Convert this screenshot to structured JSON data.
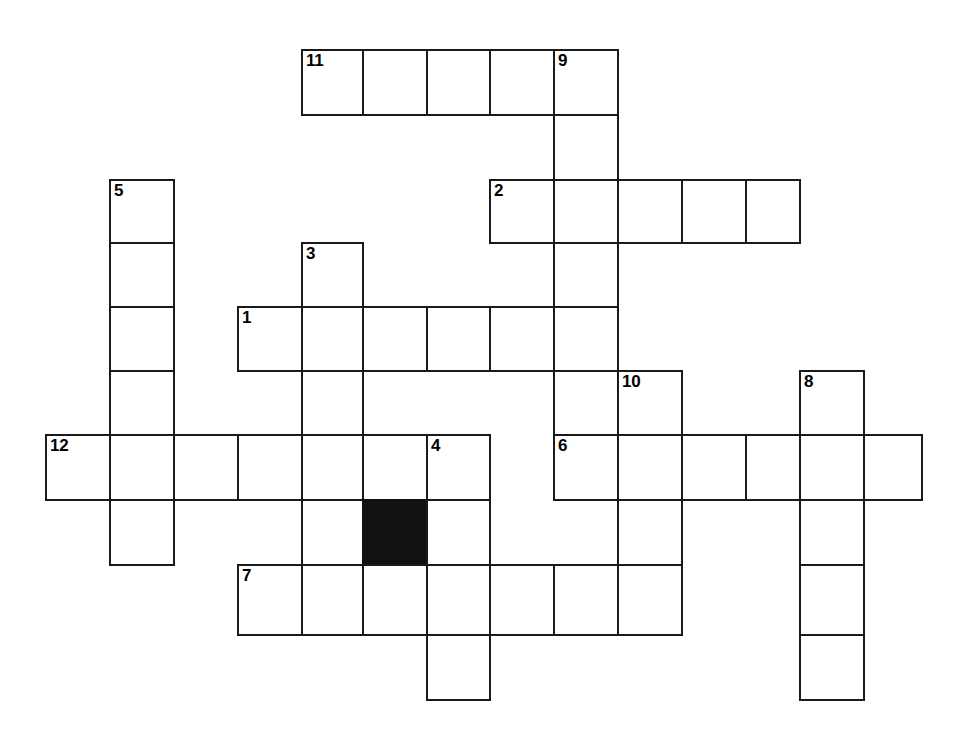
{
  "puzzle": {
    "type": "crossword-grid",
    "title": "",
    "cell_size": 64,
    "origin": {
      "x": 46,
      "y": 50
    },
    "colors": {
      "grid_line": "#1a1a1a",
      "cell_fill": "#ffffff",
      "blocked_fill": "#111111",
      "background": "#ffffff",
      "number_text": "#000000"
    },
    "columns_x": [
      46,
      110,
      174,
      238,
      302,
      363,
      427,
      490,
      554,
      618,
      682,
      746,
      800,
      864,
      922
    ],
    "rows_y": [
      50,
      115,
      180,
      243,
      307,
      371,
      435,
      500,
      565,
      635,
      700
    ],
    "clue_numbers": [
      "1",
      "2",
      "3",
      "4",
      "5",
      "6",
      "7",
      "8",
      "9",
      "10",
      "11",
      "12"
    ],
    "entries": [
      {
        "number": "11",
        "direction": "across",
        "row": 0,
        "col": 4,
        "length": 5
      },
      {
        "number": "9",
        "direction": "down",
        "row": 0,
        "col": 8,
        "length": 5
      },
      {
        "number": "5",
        "direction": "down",
        "row": 2,
        "col": 1,
        "length": 6
      },
      {
        "number": "2",
        "direction": "across",
        "row": 2,
        "col": 7,
        "length": 5
      },
      {
        "number": "3",
        "direction": "down",
        "row": 3,
        "col": 4,
        "length": 6
      },
      {
        "number": "1",
        "direction": "across",
        "row": 4,
        "col": 3,
        "length": 6
      },
      {
        "number": "10",
        "direction": "down",
        "row": 5,
        "col": 9,
        "length": 4
      },
      {
        "number": "8",
        "direction": "down",
        "row": 5,
        "col": 12,
        "length": 5
      },
      {
        "number": "12",
        "direction": "across",
        "row": 6,
        "col": 0,
        "length": 7
      },
      {
        "number": "4",
        "direction": "down",
        "row": 6,
        "col": 6,
        "length": 4
      },
      {
        "number": "6",
        "direction": "across",
        "row": 6,
        "col": 8,
        "length": 6
      },
      {
        "number": "7",
        "direction": "across",
        "row": 8,
        "col": 3,
        "length": 7
      }
    ],
    "cells": [
      {
        "row": 0,
        "col": 4,
        "number": "11",
        "letter": "",
        "blocked": false
      },
      {
        "row": 0,
        "col": 5,
        "number": "",
        "letter": "",
        "blocked": false
      },
      {
        "row": 0,
        "col": 6,
        "number": "",
        "letter": "",
        "blocked": false
      },
      {
        "row": 0,
        "col": 7,
        "number": "",
        "letter": "",
        "blocked": false
      },
      {
        "row": 0,
        "col": 8,
        "number": "9",
        "letter": "",
        "blocked": false
      },
      {
        "row": 1,
        "col": 8,
        "number": "",
        "letter": "",
        "blocked": false
      },
      {
        "row": 2,
        "col": 1,
        "number": "5",
        "letter": "",
        "blocked": false
      },
      {
        "row": 2,
        "col": 7,
        "number": "2",
        "letter": "",
        "blocked": false
      },
      {
        "row": 2,
        "col": 8,
        "number": "",
        "letter": "",
        "blocked": false
      },
      {
        "row": 2,
        "col": 9,
        "number": "",
        "letter": "",
        "blocked": false
      },
      {
        "row": 2,
        "col": 10,
        "number": "",
        "letter": "",
        "blocked": false
      },
      {
        "row": 2,
        "col": 11,
        "number": "",
        "letter": "",
        "blocked": false
      },
      {
        "row": 3,
        "col": 1,
        "number": "",
        "letter": "",
        "blocked": false
      },
      {
        "row": 3,
        "col": 4,
        "number": "3",
        "letter": "",
        "blocked": false
      },
      {
        "row": 3,
        "col": 8,
        "number": "",
        "letter": "",
        "blocked": false
      },
      {
        "row": 4,
        "col": 1,
        "number": "",
        "letter": "",
        "blocked": false
      },
      {
        "row": 4,
        "col": 3,
        "number": "1",
        "letter": "",
        "blocked": false
      },
      {
        "row": 4,
        "col": 4,
        "number": "",
        "letter": "",
        "blocked": false
      },
      {
        "row": 4,
        "col": 5,
        "number": "",
        "letter": "",
        "blocked": false
      },
      {
        "row": 4,
        "col": 6,
        "number": "",
        "letter": "",
        "blocked": false
      },
      {
        "row": 4,
        "col": 7,
        "number": "",
        "letter": "",
        "blocked": false
      },
      {
        "row": 4,
        "col": 8,
        "number": "",
        "letter": "",
        "blocked": false
      },
      {
        "row": 5,
        "col": 1,
        "number": "",
        "letter": "",
        "blocked": false
      },
      {
        "row": 5,
        "col": 4,
        "number": "",
        "letter": "",
        "blocked": false
      },
      {
        "row": 5,
        "col": 8,
        "number": "",
        "letter": "",
        "blocked": false
      },
      {
        "row": 5,
        "col": 9,
        "number": "10",
        "letter": "",
        "blocked": false
      },
      {
        "row": 5,
        "col": 12,
        "number": "8",
        "letter": "",
        "blocked": false
      },
      {
        "row": 6,
        "col": 0,
        "number": "12",
        "letter": "",
        "blocked": false
      },
      {
        "row": 6,
        "col": 1,
        "number": "",
        "letter": "",
        "blocked": false
      },
      {
        "row": 6,
        "col": 2,
        "number": "",
        "letter": "",
        "blocked": false
      },
      {
        "row": 6,
        "col": 3,
        "number": "",
        "letter": "",
        "blocked": false
      },
      {
        "row": 6,
        "col": 4,
        "number": "",
        "letter": "",
        "blocked": false
      },
      {
        "row": 6,
        "col": 5,
        "number": "",
        "letter": "",
        "blocked": false
      },
      {
        "row": 6,
        "col": 6,
        "number": "4",
        "letter": "",
        "blocked": false
      },
      {
        "row": 6,
        "col": 8,
        "number": "6",
        "letter": "",
        "blocked": false
      },
      {
        "row": 6,
        "col": 9,
        "number": "",
        "letter": "",
        "blocked": false
      },
      {
        "row": 6,
        "col": 10,
        "number": "",
        "letter": "",
        "blocked": false
      },
      {
        "row": 6,
        "col": 11,
        "number": "",
        "letter": "",
        "blocked": false
      },
      {
        "row": 6,
        "col": 12,
        "number": "",
        "letter": "",
        "blocked": false
      },
      {
        "row": 6,
        "col": 13,
        "number": "",
        "letter": "",
        "blocked": false
      },
      {
        "row": 7,
        "col": 1,
        "number": "",
        "letter": "",
        "blocked": false
      },
      {
        "row": 7,
        "col": 4,
        "number": "",
        "letter": "",
        "blocked": false
      },
      {
        "row": 7,
        "col": 5,
        "number": "",
        "letter": "",
        "blocked": true
      },
      {
        "row": 7,
        "col": 6,
        "number": "",
        "letter": "",
        "blocked": false
      },
      {
        "row": 7,
        "col": 9,
        "number": "",
        "letter": "",
        "blocked": false
      },
      {
        "row": 7,
        "col": 12,
        "number": "",
        "letter": "",
        "blocked": false
      },
      {
        "row": 8,
        "col": 3,
        "number": "7",
        "letter": "",
        "blocked": false
      },
      {
        "row": 8,
        "col": 4,
        "number": "",
        "letter": "",
        "blocked": false
      },
      {
        "row": 8,
        "col": 5,
        "number": "",
        "letter": "",
        "blocked": false
      },
      {
        "row": 8,
        "col": 6,
        "number": "",
        "letter": "",
        "blocked": false
      },
      {
        "row": 8,
        "col": 7,
        "number": "",
        "letter": "",
        "blocked": false
      },
      {
        "row": 8,
        "col": 8,
        "number": "",
        "letter": "",
        "blocked": false
      },
      {
        "row": 8,
        "col": 9,
        "number": "",
        "letter": "",
        "blocked": false
      },
      {
        "row": 8,
        "col": 12,
        "number": "",
        "letter": "",
        "blocked": false
      },
      {
        "row": 9,
        "col": 6,
        "number": "",
        "letter": "",
        "blocked": false
      },
      {
        "row": 9,
        "col": 12,
        "number": "",
        "letter": "",
        "blocked": false
      }
    ]
  }
}
